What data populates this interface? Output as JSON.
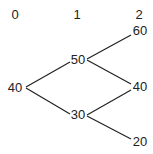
{
  "tree": {
    "periods": [
      "0",
      "1",
      "2"
    ],
    "nodes": {
      "root": "40",
      "up": "50",
      "down": "30",
      "up_up": "60",
      "mid": "40",
      "down_down": "20"
    },
    "edges": [
      [
        "root",
        "up"
      ],
      [
        "root",
        "down"
      ],
      [
        "up",
        "up_up"
      ],
      [
        "up",
        "mid"
      ],
      [
        "down",
        "mid"
      ],
      [
        "down",
        "down_down"
      ]
    ],
    "line_color": "#222222"
  }
}
